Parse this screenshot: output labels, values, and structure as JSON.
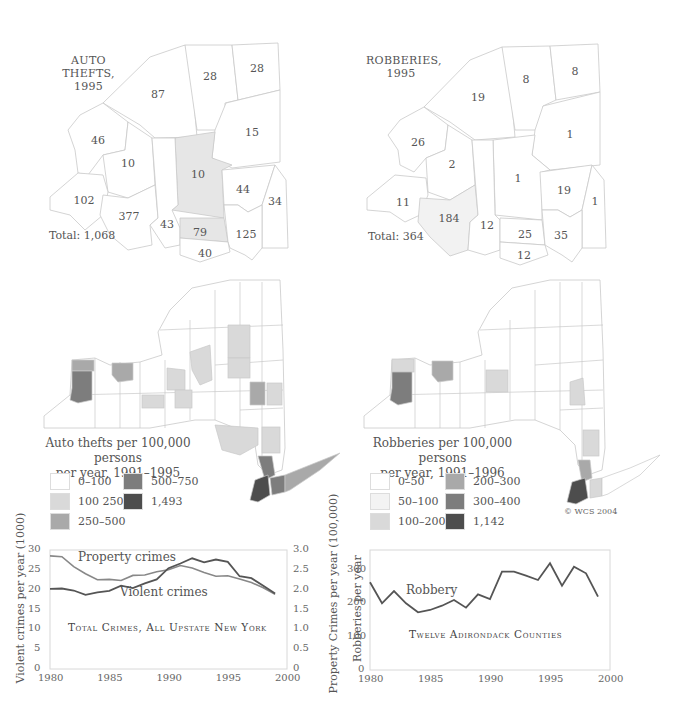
{
  "colors": {
    "bg": "#ffffff",
    "border": "#c9c9c9",
    "shade0": "#ffffff",
    "shade1": "#f3f3f3",
    "shade2": "#d9d9d9",
    "shade3": "#a9a9a9",
    "shade4": "#7d7d7d",
    "shade5": "#4d4d4d",
    "line_dark": "#555555",
    "line_light": "#888888"
  },
  "top_left_map": {
    "title_line1": "AUTO THEFTS,",
    "title_line2": "1995",
    "total": "Total: 1,068",
    "county_values": [
      "87",
      "28",
      "28",
      "46",
      "10",
      "15",
      "10",
      "44",
      "34",
      "102",
      "377",
      "43",
      "79",
      "125",
      "40"
    ]
  },
  "top_right_map": {
    "title_line1": "ROBBERIES,",
    "title_line2": "1995",
    "total": "Total: 364",
    "county_values": [
      "19",
      "8",
      "8",
      "26",
      "2",
      "1",
      "1",
      "19",
      "1",
      "11",
      "184",
      "12",
      "25",
      "35",
      "12"
    ]
  },
  "mid_left_map": {
    "legend_title_line1": "Auto thefts per 100,000 persons",
    "legend_title_line2": "per year, 1991–1995",
    "legend": [
      {
        "label": "0–100",
        "shade": "shade0"
      },
      {
        "label": "100  250",
        "shade": "shade2"
      },
      {
        "label": "250–500",
        "shade": "shade3"
      },
      {
        "label": "500–750",
        "shade": "shade4"
      },
      {
        "label": "1,493",
        "shade": "shade5"
      }
    ]
  },
  "mid_right_map": {
    "legend_title_line1": "Robberies per 100,000 persons",
    "legend_title_line2": "per year, 1991–1996",
    "legend": [
      {
        "label": "0–50",
        "shade": "shade0"
      },
      {
        "label": "50–100",
        "shade": "shade1"
      },
      {
        "label": "100–200",
        "shade": "shade2"
      },
      {
        "label": "200–300",
        "shade": "shade3"
      },
      {
        "label": "300–400",
        "shade": "shade4"
      },
      {
        "label": "1,142",
        "shade": "shade5"
      }
    ],
    "credit": "© WCS 2004"
  },
  "chart_data": [
    {
      "type": "line",
      "title": "Total Crimes, All Upstate New York",
      "xlabel": "",
      "ylabel": "Violent crimes per year (1000)",
      "ylabel_right": "Property Crimes per year (100,000)",
      "xlim": [
        1980,
        2000
      ],
      "ylim": [
        0,
        30
      ],
      "ylim_right": [
        0,
        3.0
      ],
      "x_ticks": [
        "1980",
        "1985",
        "1990",
        "1995",
        "2000"
      ],
      "y_ticks": [
        "0",
        "5",
        "10",
        "15",
        "20",
        "25",
        "30"
      ],
      "y_ticks_right": [
        "0",
        "0.5",
        "1.0",
        "1.5",
        "2.0",
        "2.5",
        "3.0"
      ],
      "grid": false,
      "legend_position": "inline labels",
      "x": [
        1980,
        1981,
        1982,
        1983,
        1984,
        1985,
        1986,
        1987,
        1988,
        1989,
        1990,
        1991,
        1992,
        1993,
        1994,
        1995,
        1996,
        1997,
        1998,
        1999
      ],
      "series": [
        {
          "name": "Property crimes",
          "axis": "right",
          "color": "#888888",
          "values": [
            2.85,
            2.83,
            2.58,
            2.4,
            2.25,
            2.26,
            2.23,
            2.36,
            2.37,
            2.45,
            2.5,
            2.61,
            2.55,
            2.43,
            2.34,
            2.35,
            2.27,
            2.18,
            2.05,
            1.88
          ]
        },
        {
          "name": "Violent crimes",
          "axis": "left",
          "color": "#555555",
          "values": [
            20.2,
            20.3,
            19.8,
            18.7,
            19.3,
            19.7,
            21.0,
            20.4,
            21.6,
            22.6,
            25.4,
            26.6,
            27.9,
            26.9,
            27.6,
            27.0,
            23.4,
            22.9,
            21.0,
            19.0
          ]
        }
      ]
    },
    {
      "type": "line",
      "title": "Twelve Adirondack Counties",
      "xlabel": "",
      "ylabel": "Robberies per year",
      "xlim": [
        1980,
        2000
      ],
      "ylim": [
        0,
        360
      ],
      "x_ticks": [
        "1980",
        "1985",
        "1990",
        "1995",
        "2000"
      ],
      "y_ticks": [
        "0",
        "100",
        "200",
        "300"
      ],
      "grid": false,
      "legend_position": "inline label",
      "x": [
        1980,
        1981,
        1982,
        1983,
        1984,
        1985,
        1986,
        1987,
        1988,
        1989,
        1990,
        1991,
        1992,
        1993,
        1994,
        1995,
        1996,
        1997,
        1998,
        1999
      ],
      "series": [
        {
          "name": "Robbery",
          "color": "#555555",
          "values": [
            263,
            200,
            237,
            200,
            173,
            180,
            193,
            210,
            187,
            227,
            213,
            295,
            295,
            283,
            270,
            320,
            253,
            310,
            290,
            220
          ]
        }
      ]
    }
  ]
}
